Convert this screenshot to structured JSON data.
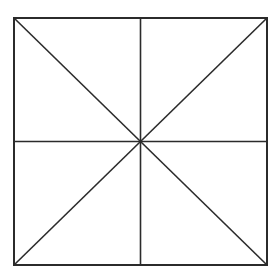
{
  "diagram": {
    "type": "square-divided-into-eight-triangles",
    "background": "#ffffff",
    "stroke_color": "#2b2b2b",
    "stroke_width": 1.6,
    "square": {
      "x1": 14,
      "y1": 18,
      "x2": 267,
      "y2": 265
    },
    "center": {
      "x": 140.5,
      "y": 141.5
    },
    "lines": [
      {
        "name": "vertical-midline",
        "x1": 140.5,
        "y1": 18,
        "x2": 140.5,
        "y2": 265
      },
      {
        "name": "horizontal-midline",
        "x1": 14,
        "y1": 141.5,
        "x2": 267,
        "y2": 141.5
      },
      {
        "name": "diagonal-tl-br",
        "x1": 14,
        "y1": 18,
        "x2": 267,
        "y2": 265
      },
      {
        "name": "diagonal-tr-bl",
        "x1": 267,
        "y1": 18,
        "x2": 14,
        "y2": 265
      }
    ]
  }
}
